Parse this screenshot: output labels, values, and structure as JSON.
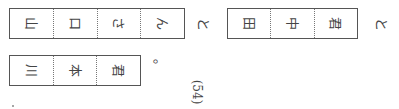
{
  "rows": [
    {
      "boxes": [
        {
          "cells": [
            "山",
            "口",
            "さ",
            "ん"
          ]
        },
        {
          "cells": [
            "田",
            "中",
            "君"
          ]
        }
      ],
      "connectors": [
        "と",
        "と"
      ]
    },
    {
      "boxes": [
        {
          "cells": [
            "川",
            "本",
            "君"
          ]
        }
      ],
      "punctuation": "。"
    }
  ],
  "label": "(54)",
  "orientation": "text rotated 90° clockwise"
}
